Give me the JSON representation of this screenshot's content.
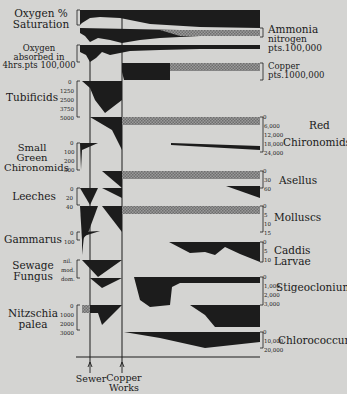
{
  "diagram": {
    "title": "",
    "left_labels": {
      "oxygen_saturation": [
        "Oxygen %",
        "Saturation"
      ],
      "oxygen_absorbed": [
        "Oxygen",
        "absorbed in",
        "4hrs.pts 100,000"
      ],
      "tubificids": "Tubificids",
      "small_green_chironomids": [
        "Small",
        "Green",
        "Chironomids"
      ],
      "leeches": "Leeches",
      "gammarus": "Gammarus",
      "sewage_fungus": [
        "Sewage",
        "Fungus"
      ],
      "nitzschia": [
        "Nitzschia",
        "palea"
      ]
    },
    "right_labels": {
      "ammonia": [
        "Ammonia",
        "nitrogen",
        "pts.100,000"
      ],
      "copper": [
        "Copper",
        "pts.1000,000"
      ],
      "red_chironomids": [
        "Red",
        "Chironomids"
      ],
      "asellus": "Asellus",
      "molluscs": "Molluscs",
      "caddis": "Caddis Larvae",
      "stigeoclonium": "Stigeoclonium",
      "chlorococcum": "Chlorococcum"
    },
    "left_ticks": {
      "tubificids": [
        "0",
        "1250",
        "2500",
        "3750",
        "5000"
      ],
      "small_green_chironomids": [
        "0",
        "100",
        "200",
        "300"
      ],
      "leeches": [
        "0",
        "20",
        "40"
      ],
      "gammarus": [
        "0",
        "100"
      ],
      "sewage_fungus": [
        "nil.",
        "mod.",
        "dom."
      ],
      "nitzschia": [
        "0",
        "1000",
        "2000",
        "3000"
      ]
    },
    "right_ticks": {
      "red_chironomids": [
        "0",
        "6,000",
        "12,000",
        "18,000",
        "24,000"
      ],
      "asellus": [
        "0",
        "30",
        "60"
      ],
      "molluscs": [
        "0",
        "5",
        "10",
        "15"
      ],
      "caddis": [
        "0",
        "5",
        "10"
      ],
      "stigeoclonium": [
        "0",
        "1,000",
        "2,000",
        "3,000"
      ],
      "chlorococcum": [
        "0",
        "10,000",
        "20,000"
      ]
    },
    "markers": {
      "sewer": "Sewer",
      "copper_works": [
        "Copper",
        "Works"
      ]
    },
    "colors": {
      "background": "#d4d4d2",
      "ink": "#1c1c1c",
      "hatch": "#8a8a8a"
    }
  }
}
